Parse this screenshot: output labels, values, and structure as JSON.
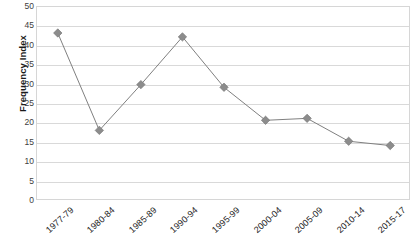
{
  "chart_data": {
    "type": "line",
    "title": "",
    "xlabel": "",
    "ylabel": "Frequency Index",
    "ylim": [
      0,
      50
    ],
    "ytick_step": 5,
    "yticks": [
      50,
      45,
      40,
      35,
      30,
      25,
      20,
      15,
      10,
      5,
      0
    ],
    "grid": true,
    "legend": "none",
    "categories": [
      "1977-79",
      "1980-84",
      "1985-89",
      "1990-94",
      "1995-99",
      "2000-04",
      "2005-09",
      "2010-14",
      "2015-17"
    ],
    "values": [
      43.3,
      18.2,
      30.0,
      42.3,
      29.3,
      20.8,
      21.3,
      15.4,
      14.3
    ],
    "series": [
      {
        "name": "Frequency Index",
        "marker": "diamond",
        "color": "#8c8c8c",
        "line_color": "#808080",
        "values": [
          43.3,
          18.2,
          30.0,
          42.3,
          29.3,
          20.8,
          21.3,
          15.4,
          14.3
        ]
      }
    ]
  },
  "colors": {
    "marker": "#8c8c8c",
    "line": "#808080",
    "gridline": "#d9d9d9",
    "plot_border": "#d6d6d6",
    "text": "#262626",
    "background": "#ffffff"
  }
}
